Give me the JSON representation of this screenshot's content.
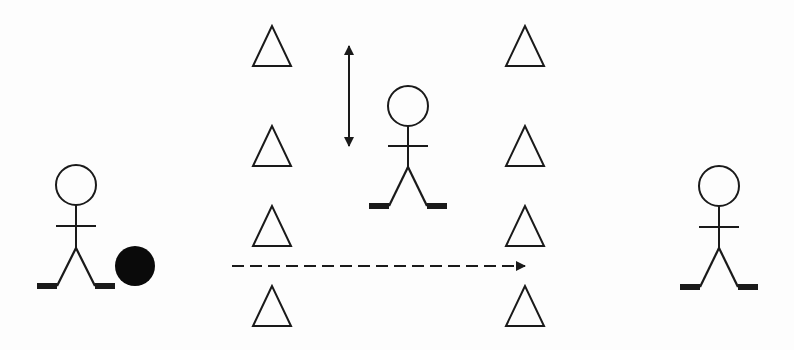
{
  "diagram": {
    "title": "",
    "colors": {
      "stroke": "#1a1a1a",
      "background": "#fdfdfd",
      "ball": "#0a0a0a"
    },
    "players": [
      {
        "id": "player-left",
        "role": "passer",
        "head": [
          76,
          185
        ],
        "neck_y": 205,
        "arm_y": 226,
        "hip_y": 248,
        "feet_y": 286
      },
      {
        "id": "player-middle",
        "role": "defender",
        "head": [
          408,
          106
        ],
        "neck_y": 126,
        "arm_y": 146,
        "hip_y": 167,
        "feet_y": 206
      },
      {
        "id": "player-right",
        "role": "receiver",
        "head": [
          719,
          186
        ],
        "neck_y": 206,
        "arm_y": 227,
        "hip_y": 248,
        "feet_y": 287
      }
    ],
    "ball": {
      "center": [
        135,
        266
      ],
      "radius": 20
    },
    "cones": {
      "left_column_x": 272,
      "right_column_x": 525,
      "apex_y": [
        26,
        126,
        206,
        286
      ],
      "height": 40,
      "half_width": 19
    },
    "arrows": [
      {
        "id": "pass-arrow",
        "style": "dashed",
        "from": [
          232,
          266
        ],
        "to": [
          525,
          266
        ]
      },
      {
        "id": "defender-movement-arrow",
        "style": "solid-double",
        "from": [
          349,
          46
        ],
        "to": [
          349,
          146
        ]
      }
    ]
  }
}
